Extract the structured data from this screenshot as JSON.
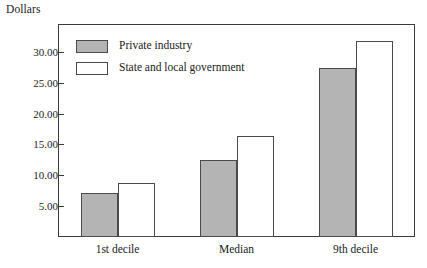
{
  "chart_data": {
    "type": "bar",
    "title": "",
    "subtitle": "",
    "xlabel": "",
    "ylabel": "Dollars",
    "categories": [
      "1st decile",
      "Median",
      "9th decile"
    ],
    "series": [
      {
        "name": "Private industry",
        "values": [
          7.2,
          12.4,
          27.3
        ],
        "color": "#b4b4b4"
      },
      {
        "name": "State and local government",
        "values": [
          8.8,
          16.4,
          31.8
        ],
        "color": "#ffffff"
      }
    ],
    "ylim": [
      0,
      34.5
    ],
    "yticks": [
      5,
      10,
      15,
      20,
      25,
      30
    ],
    "ytick_labels": [
      "5.00",
      "10.00",
      "15.00",
      "20.00",
      "25.00",
      "30.00"
    ],
    "grid": false,
    "legend_position": "top-left",
    "frame": true
  },
  "axis": {
    "y_title": "Dollars"
  },
  "legend": {
    "items": [
      {
        "label": "Private industry",
        "swatch": "gray-filled-swatch"
      },
      {
        "label": "State and local government",
        "swatch": "white-filled-swatch"
      }
    ]
  },
  "yticks": [
    {
      "label": "30.00"
    },
    {
      "label": "25.00"
    },
    {
      "label": "20.00"
    },
    {
      "label": "15.00"
    },
    {
      "label": "10.00"
    },
    {
      "label": "5.00"
    }
  ],
  "xlabels": [
    {
      "label": "1st decile"
    },
    {
      "label": "Median"
    },
    {
      "label": "9th decile"
    }
  ],
  "colors": {
    "private_industry": "#b4b4b4",
    "state_local_government": "#ffffff",
    "axis_line": "#3a3a3a",
    "bar_border": "#4a4a4a",
    "text": "#1a1a1a",
    "background": "#ffffff"
  }
}
